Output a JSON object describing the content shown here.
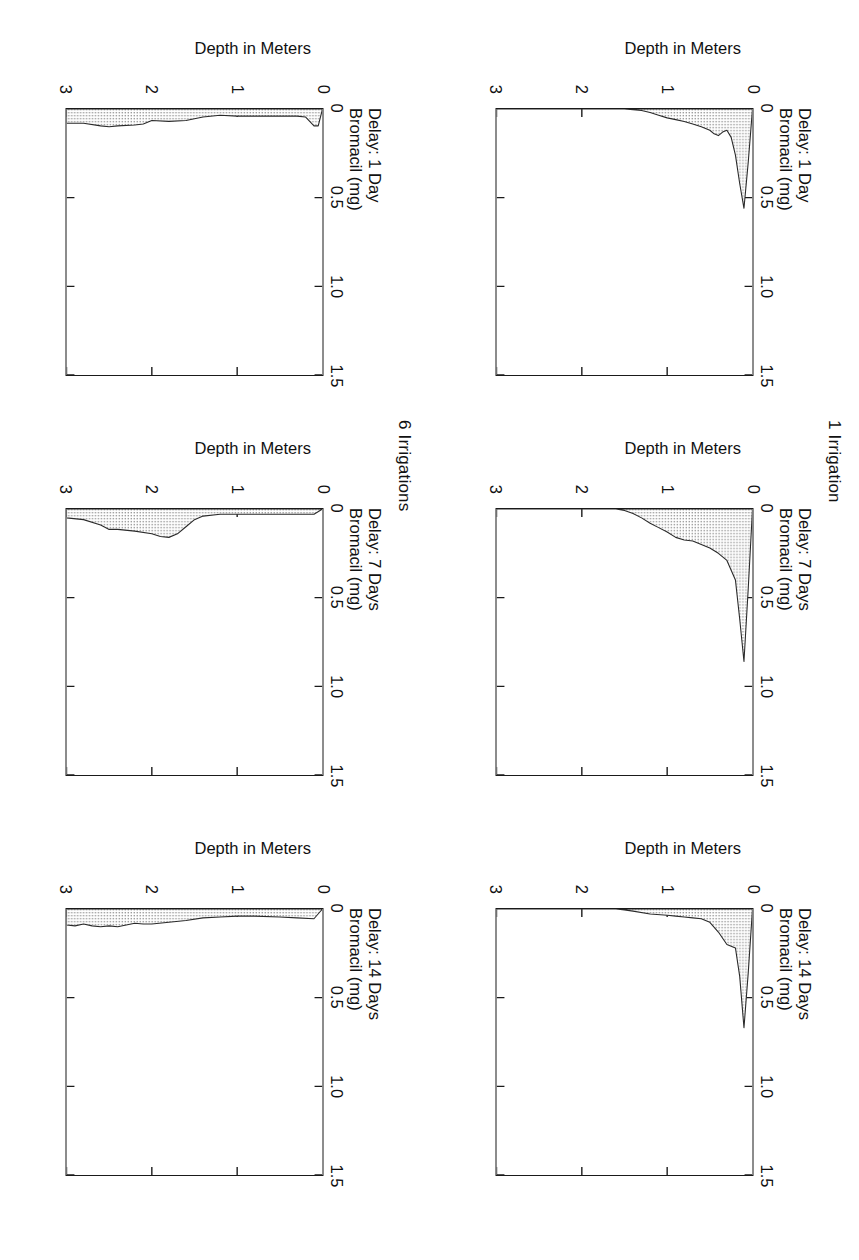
{
  "figure": {
    "row_headers": [
      {
        "label": "1 Irrigation"
      },
      {
        "label": "6 Irrigations"
      }
    ],
    "axis": {
      "x_title": "Bromacil (mg)",
      "y_title": "Depth in Meters",
      "x_ticks": [
        "0",
        "0.5",
        "1.0",
        "1.5"
      ],
      "y_ticks": [
        "0",
        "1",
        "2",
        "3"
      ]
    },
    "panel_titles": {
      "d1": "Delay: 1 Day",
      "d7": "Delay: 7 Days",
      "d14": "Delay: 14 Days"
    }
  },
  "chart_data": [
    {
      "id": "irr1-delay1",
      "type": "area",
      "title": "Delay: 1 Day",
      "group": "1 Irrigation",
      "xlabel": "Bromacil (mg)",
      "ylabel": "Depth in Meters",
      "xlim": [
        0,
        1.5
      ],
      "ylim": [
        0,
        3
      ],
      "x_ticks": [
        0,
        0.5,
        1.0,
        1.5
      ],
      "y_ticks": [
        0,
        1,
        2,
        3
      ],
      "grid": false,
      "legend": "none",
      "depth_m": [
        0.0,
        0.05,
        0.1,
        0.15,
        0.2,
        0.25,
        0.3,
        0.35,
        0.4,
        0.45,
        0.5,
        0.6,
        0.7,
        0.8,
        0.9,
        1.0,
        1.1,
        1.2,
        1.3,
        1.5,
        2.0,
        2.5,
        3.0
      ],
      "bromacil_mg": [
        0.0,
        0.3,
        0.56,
        0.42,
        0.26,
        0.16,
        0.12,
        0.13,
        0.15,
        0.14,
        0.12,
        0.1,
        0.085,
        0.07,
        0.06,
        0.05,
        0.035,
        0.02,
        0.008,
        0.0,
        0.0,
        0.0,
        0.0
      ]
    },
    {
      "id": "irr1-delay7",
      "type": "area",
      "title": "Delay: 7 Days",
      "group": "1 Irrigation",
      "xlabel": "Bromacil (mg)",
      "ylabel": "Depth in Meters",
      "xlim": [
        0,
        1.5
      ],
      "ylim": [
        0,
        3
      ],
      "x_ticks": [
        0,
        0.5,
        1.0,
        1.5
      ],
      "y_ticks": [
        0,
        1,
        2,
        3
      ],
      "grid": false,
      "legend": "none",
      "depth_m": [
        0.0,
        0.05,
        0.1,
        0.15,
        0.2,
        0.3,
        0.4,
        0.5,
        0.6,
        0.7,
        0.8,
        0.9,
        1.0,
        1.1,
        1.2,
        1.3,
        1.4,
        1.5,
        1.6,
        2.0,
        2.5,
        3.0
      ],
      "bromacil_mg": [
        0.0,
        0.45,
        0.86,
        0.62,
        0.4,
        0.29,
        0.25,
        0.22,
        0.2,
        0.18,
        0.175,
        0.16,
        0.13,
        0.105,
        0.08,
        0.05,
        0.025,
        0.008,
        0.0,
        0.0,
        0.0,
        0.0
      ]
    },
    {
      "id": "irr1-delay14",
      "type": "area",
      "title": "Delay: 14 Days",
      "group": "1 Irrigation",
      "xlabel": "Bromacil (mg)",
      "ylabel": "Depth in Meters",
      "xlim": [
        0,
        1.5
      ],
      "ylim": [
        0,
        3
      ],
      "x_ticks": [
        0,
        0.5,
        1.0,
        1.5
      ],
      "y_ticks": [
        0,
        1,
        2,
        3
      ],
      "grid": false,
      "legend": "none",
      "depth_m": [
        0.0,
        0.05,
        0.1,
        0.15,
        0.2,
        0.3,
        0.4,
        0.5,
        0.6,
        0.7,
        0.8,
        0.9,
        1.0,
        1.2,
        1.4,
        1.5,
        1.6,
        2.0,
        2.5,
        3.0
      ],
      "bromacil_mg": [
        0.0,
        0.36,
        0.67,
        0.38,
        0.22,
        0.2,
        0.13,
        0.075,
        0.055,
        0.05,
        0.045,
        0.04,
        0.035,
        0.028,
        0.012,
        0.005,
        0.0,
        0.0,
        0.0,
        0.0
      ]
    },
    {
      "id": "irr6-delay1",
      "type": "area",
      "title": "Delay: 1 Day",
      "group": "6 Irrigations",
      "xlabel": "Bromacil (mg)",
      "ylabel": "Depth in Meters",
      "xlim": [
        0,
        1.5
      ],
      "ylim": [
        0,
        3
      ],
      "x_ticks": [
        0,
        0.5,
        1.0,
        1.5
      ],
      "y_ticks": [
        0,
        1,
        2,
        3
      ],
      "grid": false,
      "legend": "none",
      "depth_m": [
        0.0,
        0.05,
        0.1,
        0.2,
        0.3,
        0.5,
        0.8,
        1.0,
        1.2,
        1.4,
        1.5,
        1.6,
        1.8,
        2.0,
        2.1,
        2.2,
        2.4,
        2.5,
        2.6,
        2.8,
        3.0
      ],
      "bromacil_mg": [
        0.0,
        0.095,
        0.095,
        0.045,
        0.04,
        0.04,
        0.04,
        0.04,
        0.035,
        0.045,
        0.055,
        0.065,
        0.07,
        0.065,
        0.085,
        0.09,
        0.095,
        0.1,
        0.095,
        0.08,
        0.08
      ]
    },
    {
      "id": "irr6-delay7",
      "type": "area",
      "title": "Delay: 7 Days",
      "group": "6 Irrigations",
      "xlabel": "Bromacil (mg)",
      "ylabel": "Depth in Meters",
      "xlim": [
        0,
        1.5
      ],
      "ylim": [
        0,
        3
      ],
      "x_ticks": [
        0,
        0.5,
        1.0,
        1.5
      ],
      "y_ticks": [
        0,
        1,
        2,
        3
      ],
      "grid": false,
      "legend": "none",
      "depth_m": [
        0.0,
        0.1,
        0.4,
        0.8,
        1.0,
        1.2,
        1.4,
        1.5,
        1.6,
        1.7,
        1.8,
        1.9,
        2.0,
        2.2,
        2.4,
        2.5,
        2.6,
        2.8,
        3.0
      ],
      "bromacil_mg": [
        0.0,
        0.03,
        0.03,
        0.03,
        0.03,
        0.03,
        0.04,
        0.06,
        0.1,
        0.14,
        0.16,
        0.155,
        0.14,
        0.125,
        0.115,
        0.115,
        0.09,
        0.06,
        0.05
      ]
    },
    {
      "id": "irr6-delay14",
      "type": "area",
      "title": "Delay: 14 Days",
      "group": "6 Irrigations",
      "xlabel": "Bromacil (mg)",
      "ylabel": "Depth in Meters",
      "xlim": [
        0,
        1.5
      ],
      "ylim": [
        0,
        3
      ],
      "x_ticks": [
        0,
        0.5,
        1.0,
        1.5
      ],
      "y_ticks": [
        0,
        1,
        2,
        3
      ],
      "grid": false,
      "legend": "none",
      "depth_m": [
        0.0,
        0.1,
        0.3,
        0.5,
        0.8,
        1.0,
        1.2,
        1.4,
        1.6,
        1.8,
        2.0,
        2.1,
        2.2,
        2.3,
        2.4,
        2.5,
        2.6,
        2.7,
        2.8,
        2.9,
        3.0
      ],
      "bromacil_mg": [
        0.0,
        0.055,
        0.05,
        0.045,
        0.04,
        0.04,
        0.045,
        0.05,
        0.065,
        0.075,
        0.085,
        0.085,
        0.08,
        0.09,
        0.1,
        0.095,
        0.1,
        0.095,
        0.085,
        0.095,
        0.09
      ]
    }
  ]
}
